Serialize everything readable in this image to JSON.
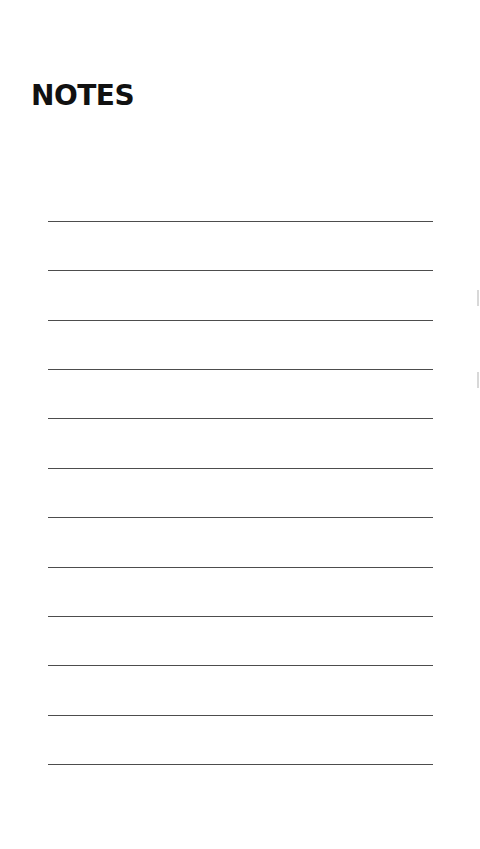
{
  "document": {
    "title": "NOTES",
    "line_count": 12,
    "lines_y": [
      221,
      270,
      320,
      369,
      418,
      468,
      517,
      567,
      616,
      665,
      715,
      764
    ],
    "line_color": "#3a3a3a",
    "background_color": "#ffffff",
    "title_color": "#111111"
  }
}
